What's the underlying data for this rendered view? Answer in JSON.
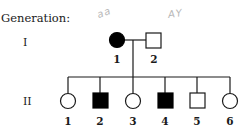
{
  "pedigree": {
    "title": "Generation:",
    "generations": [
      {
        "label": "I",
        "individuals": [
          {
            "id": "1",
            "number": "1",
            "sex": "female",
            "affected": true
          },
          {
            "id": "2",
            "number": "2",
            "sex": "male",
            "affected": false
          }
        ],
        "annotations": [
          {
            "for": "1",
            "text": "aa"
          },
          {
            "for": "2",
            "text": "AY"
          }
        ]
      },
      {
        "label": "II",
        "individuals": [
          {
            "id": "1",
            "number": "1",
            "sex": "female",
            "affected": false
          },
          {
            "id": "2",
            "number": "2",
            "sex": "male",
            "affected": true
          },
          {
            "id": "3",
            "number": "3",
            "sex": "female",
            "affected": false
          },
          {
            "id": "4",
            "number": "4",
            "sex": "male",
            "affected": true
          },
          {
            "id": "5",
            "number": "5",
            "sex": "male",
            "affected": false
          },
          {
            "id": "6",
            "number": "6",
            "sex": "female",
            "affected": false
          }
        ]
      }
    ],
    "colors": {
      "line": "#1a1a1a",
      "affected_fill": "#000000",
      "unaffected_fill": "#ffffff",
      "annotation": "#b8b8b8"
    }
  }
}
